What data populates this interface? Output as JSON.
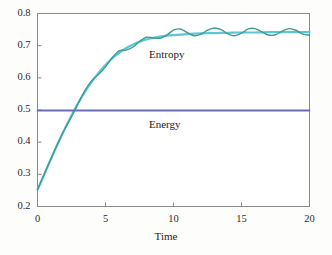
{
  "chart_data": {
    "type": "line",
    "title": "",
    "xlabel": "Time",
    "ylabel": "",
    "xlim": [
      0,
      20
    ],
    "ylim": [
      0.2,
      0.8
    ],
    "grid": false,
    "legend_position": "inline-annotations",
    "xticks": [
      "0",
      "5",
      "10",
      "15",
      "20"
    ],
    "xtick_values": [
      0,
      5,
      10,
      15,
      20
    ],
    "yticks": [
      "0.2",
      "0.3",
      "0.4",
      "0.5",
      "0.6",
      "0.7",
      "0.8"
    ],
    "ytick_values": [
      0.2,
      0.3,
      0.4,
      0.5,
      0.6,
      0.7,
      0.8
    ],
    "annotations": [
      {
        "text": "Entropy",
        "x": 8.2,
        "y": 0.672
      },
      {
        "text": "Energy",
        "x": 8.2,
        "y": 0.452
      }
    ],
    "series": [
      {
        "name": "Entropy",
        "color": "#5fc5d8",
        "style": "smooth-envelope",
        "x": [
          0,
          0.5,
          1,
          1.5,
          2,
          2.5,
          3,
          3.5,
          4,
          4.5,
          5,
          5.5,
          6,
          6.5,
          7,
          7.5,
          8,
          8.5,
          9,
          9.5,
          10,
          11,
          12,
          13,
          14,
          15,
          16,
          17,
          18,
          19,
          20
        ],
        "values": [
          0.252,
          0.3,
          0.349,
          0.396,
          0.441,
          0.483,
          0.522,
          0.557,
          0.588,
          0.616,
          0.64,
          0.661,
          0.678,
          0.692,
          0.703,
          0.712,
          0.719,
          0.724,
          0.728,
          0.731,
          0.733,
          0.736,
          0.738,
          0.739,
          0.74,
          0.741,
          0.741,
          0.742,
          0.742,
          0.742,
          0.742
        ]
      },
      {
        "name": "Entropy (oscillating)",
        "color": "#3f9c8f",
        "style": "oscillating",
        "x": [
          0,
          0.5,
          1,
          1.5,
          2,
          2.5,
          3,
          3.5,
          4,
          4.5,
          5,
          5.5,
          6,
          6.5,
          7,
          7.5,
          8,
          8.5,
          9,
          9.5,
          10,
          10.5,
          11,
          11.5,
          12,
          12.5,
          13,
          13.5,
          14,
          14.5,
          15,
          15.5,
          16,
          16.5,
          17,
          17.5,
          18,
          18.5,
          19,
          19.5,
          20
        ],
        "values": [
          0.252,
          0.301,
          0.35,
          0.397,
          0.44,
          0.479,
          0.521,
          0.562,
          0.592,
          0.611,
          0.634,
          0.663,
          0.684,
          0.686,
          0.695,
          0.713,
          0.726,
          0.724,
          0.723,
          0.733,
          0.748,
          0.752,
          0.741,
          0.731,
          0.735,
          0.748,
          0.755,
          0.75,
          0.737,
          0.731,
          0.739,
          0.752,
          0.753,
          0.743,
          0.733,
          0.734,
          0.745,
          0.753,
          0.748,
          0.736,
          0.733
        ]
      },
      {
        "name": "Energy",
        "color": "#6d6db4",
        "style": "flat",
        "x": [
          0,
          20
        ],
        "values": [
          0.4985,
          0.4985
        ]
      }
    ]
  },
  "axes": {
    "xlabel": "Time",
    "frame_color": "#8a8a8a"
  }
}
